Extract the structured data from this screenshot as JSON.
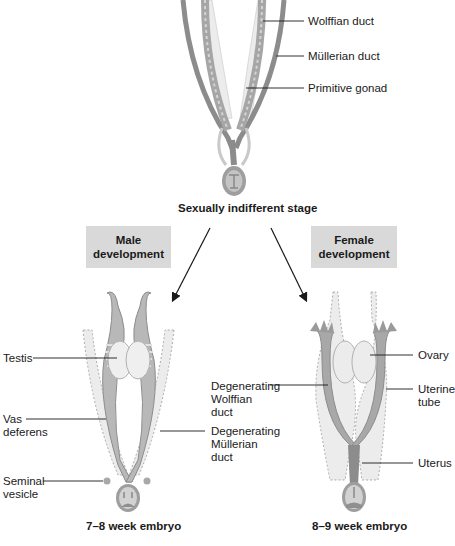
{
  "top_stage": {
    "caption": "Sexually indifferent stage",
    "labels": {
      "wolffian": "Wolffian duct",
      "mullerian": "Müllerian duct",
      "gonad": "Primitive gonad"
    }
  },
  "branches": {
    "male_box": [
      "Male",
      "development"
    ],
    "female_box": [
      "Female",
      "development"
    ]
  },
  "male_stage": {
    "caption": "7–8 week embryo",
    "labels": {
      "testis": "Testis",
      "vas_1": "Vas",
      "vas_2": "deferens",
      "seminal_1": "Seminal",
      "seminal_2": "vesicle",
      "deg_mull_1": "Degenerating",
      "deg_mull_2": "Müllerian",
      "deg_mull_3": "duct"
    }
  },
  "female_stage": {
    "caption": "8–9 week embryo",
    "labels": {
      "deg_wolf_1": "Degenerating",
      "deg_wolf_2": "Wolffian",
      "deg_wolf_3": "duct",
      "ovary": "Ovary",
      "tube_1": "Uterine",
      "tube_2": "tube",
      "uterus": "Uterus"
    }
  },
  "colors": {
    "duct": "#8c8c8c",
    "duct_light": "#b5b5b5",
    "tissue": "#e6e6e6",
    "box_fill": "#d9d9d9",
    "line": "#1a1a1a"
  }
}
